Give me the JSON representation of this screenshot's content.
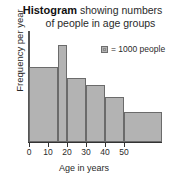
{
  "title": {
    "strong": "Histogram",
    "line1_rest": " showing numbers",
    "line2": "of people in age groups"
  },
  "legend": {
    "swatch_icon": "square-swatch-icon",
    "text": "= 1000 people"
  },
  "axes": {
    "ylabel": "Frequency per year",
    "xlabel": "Age in years"
  },
  "chart_data": {
    "type": "bar",
    "title": "Histogram showing numbers of people in age groups",
    "xlabel": "Age in years",
    "ylabel": "Frequency per year",
    "xlim": [
      0,
      70
    ],
    "ylim": [
      0,
      1.15
    ],
    "grid": false,
    "legend_position": "upper-right",
    "legend_entries": [
      "= 1000 people"
    ],
    "bin_edges": [
      0,
      15,
      20,
      30,
      40,
      50,
      70
    ],
    "categories": [
      "0-15",
      "15-20",
      "20-30",
      "30-40",
      "40-50",
      "50-70"
    ],
    "values": [
      0.78,
      1.0,
      0.66,
      0.59,
      0.47,
      0.31
    ],
    "tick_values": [
      0,
      10,
      20,
      30,
      40,
      50
    ],
    "tick_labels": [
      "0",
      "10",
      "20",
      "30",
      "40",
      "50"
    ],
    "bar_color": "#b3b3b3",
    "bar_edge_color": "#6b6b6b",
    "axis_color": "#333333",
    "background": "#ffffff"
  }
}
